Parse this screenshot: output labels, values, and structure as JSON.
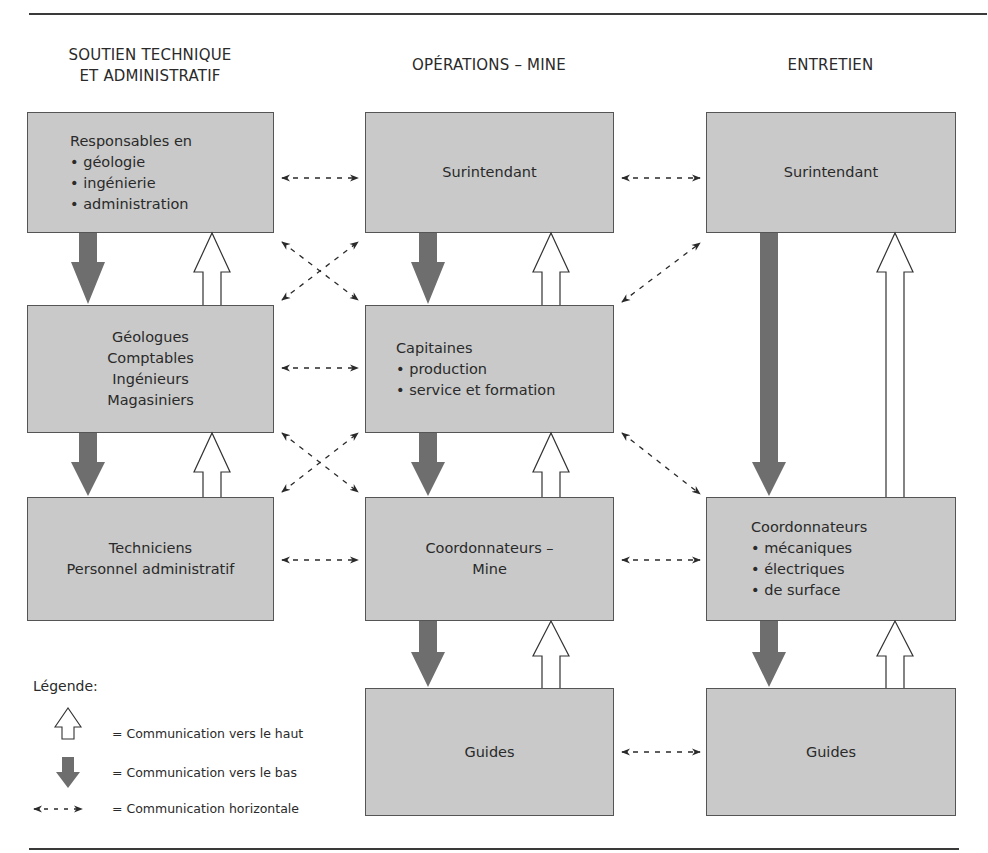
{
  "columns": [
    {
      "title_lines": [
        "SOUTIEN TECHNIQUE",
        "ET ADMINISTRATIF"
      ]
    },
    {
      "title_lines": [
        "OPÉRATIONS – MINE"
      ]
    },
    {
      "title_lines": [
        "ENTRETIEN"
      ]
    }
  ],
  "boxes": {
    "soutien_responsables": {
      "heading": "Responsables en",
      "bullets": [
        "géologie",
        "ingénierie",
        "administration"
      ]
    },
    "soutien_staff": {
      "lines": [
        "Géologues",
        "Comptables",
        "Ingénieurs",
        "Magasiniers"
      ]
    },
    "soutien_techniciens": {
      "lines": [
        "Techniciens",
        "Personnel administratif"
      ]
    },
    "mine_surintendant": {
      "lines": [
        "Surintendant"
      ]
    },
    "mine_capitaines": {
      "heading": "Capitaines",
      "bullets": [
        "production",
        "service et formation"
      ]
    },
    "mine_coordonnateurs": {
      "lines": [
        "Coordonnateurs –",
        "Mine"
      ]
    },
    "mine_guides": {
      "lines": [
        "Guides"
      ]
    },
    "entretien_surintendant": {
      "lines": [
        "Surintendant"
      ]
    },
    "entretien_coordonnateurs": {
      "heading": "Coordonnateurs",
      "bullets": [
        "mécaniques",
        "électriques",
        "de surface"
      ]
    },
    "entretien_guides": {
      "lines": [
        "Guides"
      ]
    }
  },
  "bullet_glyph": "•",
  "legend": {
    "title": "Légende:",
    "items": [
      {
        "icon": "up-arrow-outline-icon",
        "label": "= Communication vers le haut"
      },
      {
        "icon": "down-arrow-filled-icon",
        "label": "= Communication vers le bas"
      },
      {
        "icon": "dashed-double-arrow-icon",
        "label": "= Communication horizontale"
      }
    ]
  },
  "colors": {
    "box_fill": "#c9c9c9",
    "box_border": "#555555",
    "down_arrow": "#6e6e6e",
    "up_arrow_fill": "#ffffff",
    "line": "#2a2a2a"
  }
}
